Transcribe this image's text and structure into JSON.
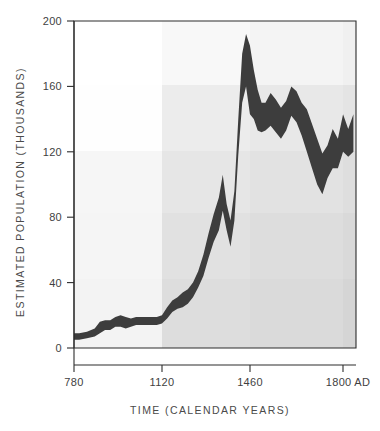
{
  "chart_data": {
    "type": "area",
    "title": "",
    "xlabel": "TIME (CALENDAR YEARS)",
    "ylabel": "ESTIMATED POPULATION (THOUSANDS)",
    "xlim": [
      780,
      1870
    ],
    "ylim": [
      0,
      200
    ],
    "x_ticks": [
      780,
      1120,
      1460,
      1800
    ],
    "x_tick_labels": [
      "780",
      "1120",
      "1460",
      "1800 AD"
    ],
    "y_ticks": [
      0,
      40,
      80,
      120,
      160,
      200
    ],
    "y_tick_labels": [
      "0",
      "40",
      "80",
      "120",
      "160",
      "200"
    ],
    "grid": false,
    "legend": "none",
    "series": [
      {
        "name": "Estimated population (upper bound)",
        "x": [
          780,
          800,
          830,
          860,
          880,
          900,
          920,
          940,
          960,
          980,
          1000,
          1020,
          1040,
          1060,
          1080,
          1100,
          1120,
          1140,
          1160,
          1180,
          1200,
          1220,
          1240,
          1260,
          1280,
          1300,
          1320,
          1340,
          1355,
          1370,
          1385,
          1400,
          1415,
          1430,
          1445,
          1460,
          1475,
          1490,
          1505,
          1520,
          1540,
          1560,
          1580,
          1600,
          1620,
          1640,
          1660,
          1680,
          1700,
          1720,
          1740,
          1760,
          1780,
          1800,
          1820,
          1840,
          1860
        ],
        "values": [
          9,
          9,
          10,
          12,
          16,
          17,
          17,
          19,
          20,
          19,
          18,
          19,
          19,
          19,
          19,
          19,
          20,
          25,
          29,
          31,
          34,
          36,
          40,
          47,
          57,
          70,
          82,
          92,
          106,
          88,
          78,
          96,
          140,
          180,
          192,
          185,
          170,
          158,
          150,
          150,
          156,
          152,
          147,
          151,
          160,
          157,
          150,
          146,
          137,
          128,
          119,
          124,
          134,
          128,
          143,
          134,
          143
        ]
      },
      {
        "name": "Estimated population (lower bound)",
        "x": [
          780,
          800,
          830,
          860,
          880,
          900,
          920,
          940,
          960,
          980,
          1000,
          1020,
          1040,
          1060,
          1080,
          1100,
          1120,
          1140,
          1160,
          1180,
          1200,
          1220,
          1240,
          1260,
          1280,
          1300,
          1320,
          1340,
          1355,
          1370,
          1385,
          1400,
          1415,
          1430,
          1445,
          1460,
          1475,
          1490,
          1505,
          1520,
          1540,
          1560,
          1580,
          1600,
          1620,
          1640,
          1660,
          1680,
          1700,
          1720,
          1740,
          1760,
          1780,
          1800,
          1820,
          1840,
          1860
        ],
        "values": [
          5,
          5,
          6,
          7,
          9,
          11,
          11,
          13,
          13,
          12,
          13,
          14,
          14,
          14,
          14,
          14,
          15,
          18,
          22,
          24,
          25,
          27,
          31,
          37,
          44,
          55,
          65,
          72,
          84,
          72,
          62,
          78,
          118,
          150,
          160,
          143,
          140,
          133,
          132,
          133,
          136,
          132,
          128,
          133,
          142,
          138,
          130,
          120,
          110,
          100,
          94,
          104,
          110,
          110,
          120,
          117,
          120
        ]
      }
    ],
    "series_color": "#3d3d3d",
    "annotations": [],
    "background_bands": {
      "note": "Overlapping grey rectangular bands behind the plot",
      "vertical": [
        {
          "x_start": 780,
          "x_end": 1120,
          "shade": "#f4f4f4"
        },
        {
          "x_start": 1120,
          "x_end": 1460,
          "shade": "#e6e6e6"
        },
        {
          "x_start": 1460,
          "x_end": 1800,
          "shade": "#dcdcdc"
        },
        {
          "x_start": 1800,
          "x_end": 1870,
          "shade": "#d2d2d2"
        }
      ],
      "horizontal": [
        {
          "y_start": 160,
          "y_end": 200,
          "shade": "#fbfbfb"
        },
        {
          "y_start": 120,
          "y_end": 160,
          "shade": "#f0f0f0"
        },
        {
          "y_start": 78,
          "y_end": 120,
          "shade": "#ebebeb"
        },
        {
          "y_start": 38,
          "y_end": 78,
          "shade": "#e4e4e4"
        },
        {
          "y_start": 0,
          "y_end": 38,
          "shade": "#dedede"
        }
      ]
    }
  },
  "axes": {
    "frame_color": "#2c2c2c"
  }
}
